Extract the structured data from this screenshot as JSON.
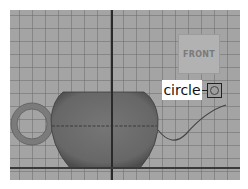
{
  "viewport": {
    "background_color": "#a4a4a4",
    "grid_color": "#6e6e6e",
    "axis_color": "#2a2a2a"
  },
  "view_cube": {
    "label": "FRONT"
  },
  "scene": {
    "objects": [
      {
        "name": "pot-body",
        "color": "#6f6f6f",
        "type": "sphere-cut"
      },
      {
        "name": "handle",
        "color": "#7a7a7a",
        "type": "torus"
      },
      {
        "name": "spout-curve",
        "color": "#444444",
        "type": "nurbs-curve"
      }
    ]
  },
  "annotation": {
    "label": "circle",
    "icon": "circle-node-icon"
  }
}
